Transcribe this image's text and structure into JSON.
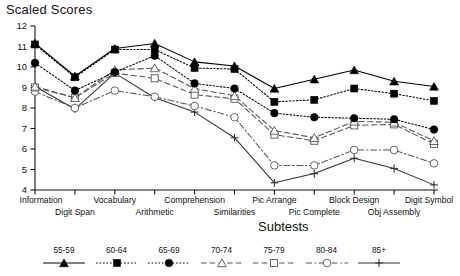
{
  "chart_data": {
    "type": "line",
    "title": "Scaled Scores",
    "xlabel": "Subtests",
    "ylabel": "Scaled Scores",
    "ylim": [
      4,
      12
    ],
    "yticks": [
      4,
      5,
      6,
      7,
      8,
      9,
      10,
      11,
      12
    ],
    "grid": false,
    "legend_position": "bottom",
    "categories": [
      "Information",
      "Digit Span",
      "Vocabulary",
      "Arithmetic",
      "Comprehension",
      "Similarities",
      "Pic Arrange",
      "Pic Complete",
      "Block Design",
      "Obj Assembly",
      "Digit Symbol"
    ],
    "series": [
      {
        "name": "55-59",
        "marker": "filled-triangle",
        "line_style": "solid",
        "color": "#000000",
        "values": [
          11.15,
          9.55,
          10.9,
          11.15,
          10.25,
          10.05,
          8.95,
          9.4,
          9.85,
          9.3,
          9.05
        ]
      },
      {
        "name": "60-64",
        "marker": "filled-square",
        "line_style": "dotted",
        "color": "#000000",
        "values": [
          11.1,
          9.5,
          10.85,
          10.85,
          9.95,
          9.9,
          8.3,
          8.4,
          8.95,
          8.7,
          8.35
        ]
      },
      {
        "name": "65-69",
        "marker": "filled-circle",
        "line_style": "dotted",
        "color": "#000000",
        "values": [
          10.2,
          8.85,
          9.75,
          10.55,
          9.2,
          8.95,
          7.75,
          7.55,
          7.5,
          7.45,
          6.95
        ]
      },
      {
        "name": "70-74",
        "marker": "open-triangle",
        "line_style": "dashed",
        "color": "#555555",
        "values": [
          9.05,
          8.5,
          9.85,
          9.95,
          8.95,
          8.6,
          6.9,
          6.55,
          7.35,
          7.3,
          6.4
        ]
      },
      {
        "name": "75-79",
        "marker": "open-square",
        "line_style": "dashed",
        "color": "#555555",
        "values": [
          9.0,
          8.5,
          9.7,
          9.45,
          8.65,
          8.45,
          6.7,
          6.4,
          7.15,
          7.2,
          6.25
        ]
      },
      {
        "name": "80-84",
        "marker": "open-circle",
        "line_style": "dashdot",
        "color": "#555555",
        "values": [
          8.8,
          8.0,
          8.85,
          8.55,
          8.1,
          7.55,
          5.2,
          5.2,
          5.95,
          5.95,
          5.3
        ]
      },
      {
        "name": "85+",
        "marker": "plus",
        "line_style": "solid",
        "color": "#333333",
        "values": [
          9.05,
          7.95,
          9.7,
          8.5,
          7.8,
          6.55,
          4.35,
          4.8,
          5.55,
          5.05,
          4.25
        ]
      }
    ]
  },
  "legend": {
    "entries": [
      {
        "label": "55-59"
      },
      {
        "label": "60-64"
      },
      {
        "label": "65-69"
      },
      {
        "label": "70-74"
      },
      {
        "label": "75-79"
      },
      {
        "label": "80-84"
      },
      {
        "label": "85+"
      }
    ]
  }
}
